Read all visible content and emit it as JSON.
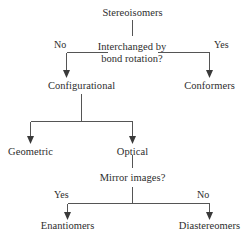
{
  "diagram": {
    "title_text": "Stereoisomers",
    "type": "classification-flowchart",
    "background_color": "#ffffff",
    "line_color": "#555555",
    "text_color": "#2d2d2d",
    "nodes": [
      {
        "id": "stereoisomers",
        "label": "Stereoisomers",
        "kind": "root"
      },
      {
        "id": "bond_rotation",
        "label_line1": "Interchanged by",
        "label_line2": "bond rotation?",
        "kind": "decision"
      },
      {
        "id": "configurational",
        "label": "Configurational",
        "kind": "category"
      },
      {
        "id": "conformers",
        "label": "Conformers",
        "kind": "leaf"
      },
      {
        "id": "geometric",
        "label": "Geometric",
        "kind": "leaf"
      },
      {
        "id": "optical",
        "label": "Optical",
        "kind": "category"
      },
      {
        "id": "mirror_images",
        "label": "Mirror images?",
        "kind": "decision"
      },
      {
        "id": "enantiomers",
        "label": "Enantiomers",
        "kind": "leaf"
      },
      {
        "id": "diastereomers",
        "label": "Diastereomers",
        "kind": "leaf"
      }
    ],
    "edge_labels": {
      "rotation_no": "No",
      "rotation_yes": "Yes",
      "mirror_yes": "Yes",
      "mirror_no": "No"
    }
  }
}
